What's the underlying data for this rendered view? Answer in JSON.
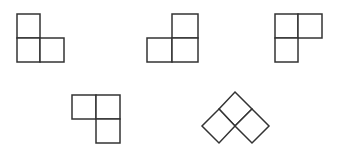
{
  "diagram": {
    "title": "",
    "stroke_color": "#333333",
    "fill_color": "#ffffff",
    "stroke_width": 1.5,
    "shapes": [
      {
        "name": "l-tromino-1",
        "orientation": "upright, extra square top-left",
        "squares": [
          {
            "x": 17,
            "y": 14,
            "w": 23,
            "h": 24
          },
          {
            "x": 17,
            "y": 38,
            "w": 23,
            "h": 24
          },
          {
            "x": 40,
            "y": 38,
            "w": 24,
            "h": 24
          }
        ]
      },
      {
        "name": "l-tromino-2",
        "orientation": "upright, extra square top-right",
        "squares": [
          {
            "x": 172,
            "y": 14,
            "w": 26,
            "h": 24
          },
          {
            "x": 147,
            "y": 38,
            "w": 25,
            "h": 24
          },
          {
            "x": 172,
            "y": 38,
            "w": 26,
            "h": 24
          }
        ]
      },
      {
        "name": "l-tromino-3",
        "orientation": "two on top, extra square bottom-left",
        "squares": [
          {
            "x": 275,
            "y": 14,
            "w": 23,
            "h": 24
          },
          {
            "x": 298,
            "y": 14,
            "w": 24,
            "h": 24
          },
          {
            "x": 275,
            "y": 38,
            "w": 23,
            "h": 24
          }
        ]
      },
      {
        "name": "l-tromino-4",
        "orientation": "two on top, extra square bottom-right",
        "squares": [
          {
            "x": 72,
            "y": 95,
            "w": 24,
            "h": 24
          },
          {
            "x": 96,
            "y": 95,
            "w": 24,
            "h": 24
          },
          {
            "x": 96,
            "y": 119,
            "w": 24,
            "h": 24
          }
        ]
      },
      {
        "name": "l-tromino-5-rotated",
        "orientation": "rotated 45 degrees (diamond)",
        "polygons": [
          "235,92 252,109 235,126 219,109",
          "219,109 235,126 219,143 202,126",
          "252,109 269,126 252,143 235,126"
        ]
      }
    ]
  }
}
